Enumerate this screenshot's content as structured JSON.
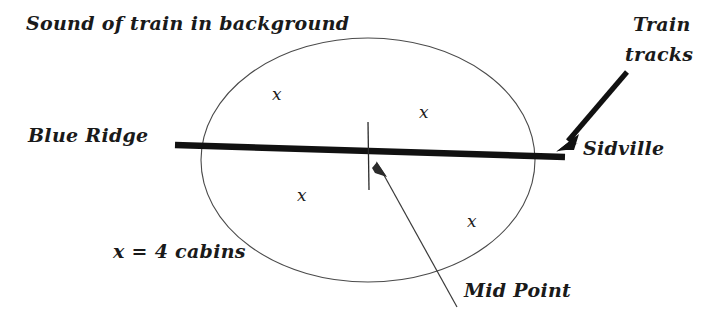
{
  "diagram": {
    "title_note": "Sound of train in background",
    "labels": {
      "sound_of_train": "Sound of train in background",
      "blue_ridge": "Blue Ridge",
      "sidville": "Sidville",
      "train_tracks_line1": "Train",
      "train_tracks_line2": "tracks",
      "mid_point": "Mid Point",
      "legend": "x = 4 cabins"
    },
    "cabin_marks": [
      {
        "id": "top-left",
        "symbol": "x"
      },
      {
        "id": "top-right",
        "symbol": "x"
      },
      {
        "id": "bottom-left",
        "symbol": "x"
      },
      {
        "id": "bottom-right",
        "symbol": "x"
      }
    ],
    "colors": {
      "ink": "#1a1a1a",
      "track": "#111111",
      "ellipse_stroke": "#4a4a4a",
      "background": "#ffffff"
    }
  }
}
